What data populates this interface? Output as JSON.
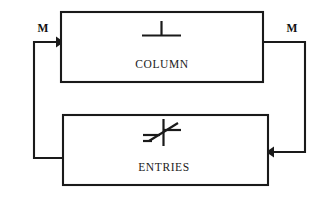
{
  "diagram": {
    "type": "block-flow-diagram",
    "background_color": "#ffffff",
    "line_color": "#1a1a1a",
    "blocks": [
      {
        "id": "column",
        "label": "COLUMN",
        "symbol_name": "up-tack-icon",
        "symbol_glyph": "⊥",
        "x": 61,
        "y": 12,
        "width": 202,
        "height": 70
      },
      {
        "id": "entries",
        "label": "ENTRIES",
        "symbol_name": "variable-adjust-icon",
        "symbol_glyph": "≠",
        "x": 63,
        "y": 115,
        "width": 205,
        "height": 70
      }
    ],
    "flow_labels": [
      {
        "id": "m-left",
        "text": "M",
        "x": 43,
        "y": 32
      },
      {
        "id": "m-right",
        "text": "M",
        "x": 292,
        "y": 32
      }
    ],
    "connections": [
      {
        "id": "feedback-left",
        "from": "entries",
        "to": "column",
        "direction": "right",
        "label": "M",
        "path": "M 63 158 L 34 158 L 34 42 L 61 42"
      },
      {
        "id": "feedback-right",
        "from": "column",
        "to": "entries",
        "direction": "left",
        "label": "M",
        "path": "M 263 42 L 305 42 L 305 152 L 268 152"
      }
    ]
  }
}
